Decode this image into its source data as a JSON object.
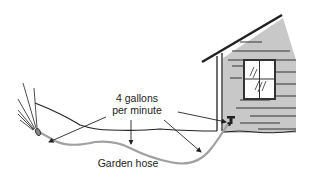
{
  "diagram": {
    "labels": {
      "flow_rate_line1": "4 gallons",
      "flow_rate_line2": "per minute",
      "hose": "Garden hose"
    },
    "elements": [
      "house-with-window",
      "water-faucet",
      "garden-hose",
      "spray-nozzle",
      "water-spray",
      "ground-line",
      "flow-arrows"
    ],
    "colors": {
      "house_wall": "#c8c8c8",
      "hose": "#a0a0a0",
      "line": "#222222"
    }
  }
}
